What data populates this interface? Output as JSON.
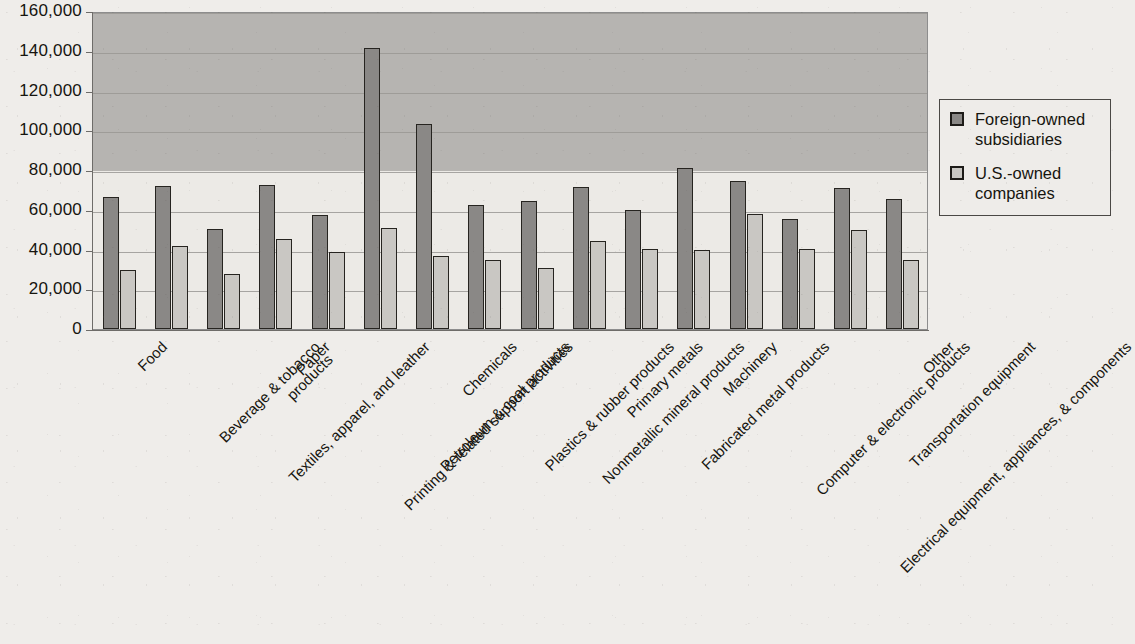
{
  "chart_data": {
    "type": "bar",
    "title": "",
    "xlabel": "",
    "ylabel": "",
    "ylim": [
      0,
      160000
    ],
    "ytick_step": 20000,
    "grid": true,
    "legend_position": "right",
    "categories": [
      "Food",
      "Beverage & tobacco\nproducts",
      "Textiles, apparel, and leather",
      "Paper",
      "Printing & related support activities",
      "Petroleum & coal products",
      "Chemicals",
      "Plastics & rubber products",
      "Nonmetallic mineral products",
      "Primary metals",
      "Fabricated metal products",
      "Machinery",
      "Computer & electronic products",
      "Electrical equipment, appliances, & components",
      "Transportation equipment",
      "Other"
    ],
    "ytick_labels": [
      "0",
      "20,000",
      "40,000",
      "60,000",
      "80,000",
      "100,000",
      "120,000",
      "140,000",
      "160,000"
    ],
    "series": [
      {
        "name": "Foreign-owned subsidiaries",
        "color": "#8a8886",
        "values": [
          66500,
          72000,
          50500,
          72500,
          57500,
          141500,
          103000,
          62500,
          64500,
          71500,
          60000,
          81000,
          74500,
          55500,
          71000,
          65500
        ]
      },
      {
        "name": "U.S.-owned companies",
        "color": "#c9c7c3",
        "values": [
          29500,
          42000,
          27500,
          45500,
          38500,
          51000,
          36500,
          34500,
          30500,
          44500,
          40500,
          40000,
          58000,
          40500,
          50000,
          34500
        ]
      }
    ]
  },
  "legend": {
    "items": [
      {
        "label": "Foreign-owned\nsubsidiaries",
        "swatch": "foreign"
      },
      {
        "label": "U.S.-owned\ncompanies",
        "swatch": "us"
      }
    ]
  },
  "colors": {
    "foreign_bar": "#8a8886",
    "us_bar": "#c9c7c3",
    "bar_outline": "#262420",
    "plot_upper_shade": "#b6b4b1",
    "plot_lower_shade": "#eceae6",
    "page_background": "#efedea",
    "gridline": "#9a9894"
  }
}
